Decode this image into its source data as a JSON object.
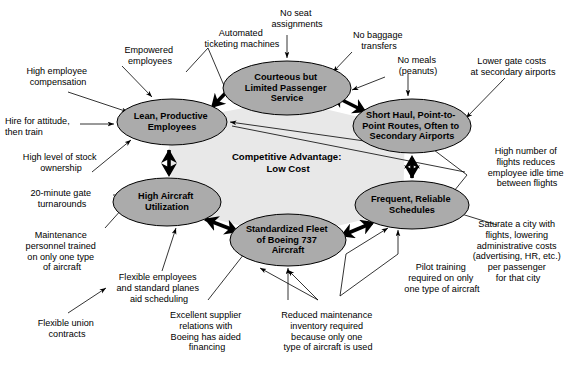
{
  "diagram": {
    "type": "activity-system-map",
    "core": {
      "line1": "Competitive Advantage:",
      "line2": "Low Cost"
    },
    "colors": {
      "node_fill": "#ababab",
      "core_fill": "#e8e8e8",
      "background": "#ffffff",
      "stroke": "#000000"
    },
    "nodes": [
      {
        "id": "courteous-service",
        "lines": [
          "Courteous but",
          "Limited Passenger",
          "Service"
        ],
        "cx": 287,
        "cy": 88,
        "rx": 64,
        "ry": 27
      },
      {
        "id": "lean-employees",
        "lines": [
          "Lean, Productive",
          "Employees"
        ],
        "cx": 172,
        "cy": 122,
        "rx": 55,
        "ry": 23
      },
      {
        "id": "short-haul-routes",
        "lines": [
          "Short Haul, Point-to-",
          "Point Routes, Often to",
          "Secondary Airports"
        ],
        "cx": 412,
        "cy": 126,
        "rx": 59,
        "ry": 27
      },
      {
        "id": "high-aircraft-utilization",
        "lines": [
          "High Aircraft",
          "Utilization"
        ],
        "cx": 167,
        "cy": 202,
        "rx": 54,
        "ry": 24
      },
      {
        "id": "frequent-schedules",
        "lines": [
          "Frequent, Reliable",
          "Schedules"
        ],
        "cx": 412,
        "cy": 205,
        "rx": 57,
        "ry": 24
      },
      {
        "id": "standardized-fleet",
        "lines": [
          "Standardized Fleet",
          "of Boeing 737",
          "Aircraft"
        ],
        "cx": 288,
        "cy": 240,
        "rx": 58,
        "ry": 26
      }
    ],
    "drivers": [
      {
        "id": "automated-ticketing",
        "lines": [
          "Automated",
          "ticketing machines"
        ],
        "x": 186,
        "y": 28,
        "align": "center",
        "width": 112
      },
      {
        "id": "no-seat-assignments",
        "lines": [
          "No seat",
          "assignments"
        ],
        "x": 257,
        "y": 8,
        "align": "center",
        "width": 80
      },
      {
        "id": "no-baggage-transfers",
        "lines": [
          "No baggage",
          "transfers"
        ],
        "x": 340,
        "y": 30,
        "align": "center",
        "width": 78
      },
      {
        "id": "no-meals-peanuts",
        "lines": [
          "No meals",
          "(peanuts)"
        ],
        "x": 385,
        "y": 55,
        "align": "center",
        "width": 66
      },
      {
        "id": "lower-gate-costs",
        "lines": [
          "Lower gate costs",
          "at secondary airports"
        ],
        "x": 455,
        "y": 56,
        "align": "center",
        "width": 116
      },
      {
        "id": "empowered-employees",
        "lines": [
          "Empowered",
          "employees"
        ],
        "x": 110,
        "y": 45,
        "align": "center",
        "width": 80
      },
      {
        "id": "high-employee-compensation",
        "lines": [
          "High employee",
          "compensation"
        ],
        "x": 8,
        "y": 66,
        "align": "left",
        "width": 100
      },
      {
        "id": "hire-for-attitude",
        "lines": [
          "Hire for attitude,",
          "then train"
        ],
        "x": 5,
        "y": 116,
        "align": "left",
        "width": 100
      },
      {
        "id": "high-stock-ownership",
        "lines": [
          "High level of stock",
          "ownership"
        ],
        "x": 8,
        "y": 152,
        "align": "left",
        "width": 106
      },
      {
        "id": "twenty-minute-turnarounds",
        "lines": [
          "20-minute gate",
          "turnarounds"
        ],
        "x": 16,
        "y": 188,
        "align": "left",
        "width": 92
      },
      {
        "id": "maintenance-personnel-trained",
        "lines": [
          "Maintenance",
          "personnel trained",
          "on only one type",
          "of aircraft"
        ],
        "x": 10,
        "y": 230,
        "align": "center",
        "width": 104
      },
      {
        "id": "flexible-union-contracts",
        "lines": [
          "Flexible union",
          "contracts"
        ],
        "x": 22,
        "y": 318,
        "align": "center",
        "width": 90
      },
      {
        "id": "flexible-employees-scheduling",
        "lines": [
          "Flexible employees",
          "and standard planes",
          "aid scheduling"
        ],
        "x": 101,
        "y": 272,
        "align": "center",
        "width": 116
      },
      {
        "id": "excellent-supplier-relations",
        "lines": [
          "Excellent supplier",
          "relations with",
          "Boeing has aided",
          "financing"
        ],
        "x": 152,
        "y": 310,
        "align": "center",
        "width": 110
      },
      {
        "id": "reduced-maintenance-inventory",
        "lines": [
          "Reduced maintenance",
          "inventory required",
          "because only one",
          "type of aircraft is used"
        ],
        "x": 264,
        "y": 310,
        "align": "center",
        "width": 128
      },
      {
        "id": "pilot-training-one-type",
        "lines": [
          "Pilot training",
          "required on only",
          "one type of aircraft"
        ],
        "x": 385,
        "y": 262,
        "align": "center",
        "width": 114
      },
      {
        "id": "high-number-of-flights",
        "lines": [
          "High number of",
          "flights reduces",
          "employee idle time",
          "between flights"
        ],
        "x": 480,
        "y": 146,
        "align": "center",
        "width": 94
      },
      {
        "id": "saturate-a-city",
        "lines": [
          "Saturate a city with",
          "flights, lowering",
          "administrative costs",
          "(advertising, HR, etc.)",
          "per passenger",
          "for that city"
        ],
        "x": 462,
        "y": 219,
        "align": "center",
        "width": 112
      }
    ]
  }
}
